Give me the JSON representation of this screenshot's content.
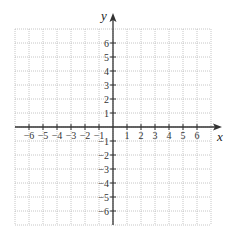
{
  "diagram": {
    "type": "coordinate-plane",
    "axes": {
      "x_label": "x",
      "y_label": "y",
      "x_range": [
        -7,
        7
      ],
      "y_range": [
        -7,
        7
      ]
    },
    "x_tick_labels": [
      "−6",
      "−5",
      "−4",
      "−3",
      "−2",
      "−1",
      "1",
      "2",
      "3",
      "4",
      "5",
      "6"
    ],
    "x_tick_values": [
      -6,
      -5,
      -4,
      -3,
      -2,
      -1,
      1,
      2,
      3,
      4,
      5,
      6
    ],
    "y_tick_labels": [
      "6",
      "5",
      "4",
      "3",
      "2",
      "1",
      "−1",
      "−2",
      "−3",
      "−4",
      "−5",
      "−6"
    ],
    "y_tick_values": [
      6,
      5,
      4,
      3,
      2,
      1,
      -1,
      -2,
      -3,
      -4,
      -5,
      -6
    ],
    "grid": {
      "style": "dotted",
      "spacing_units": 1,
      "color": "#b8b8b8"
    },
    "colors": {
      "axis": "#333333",
      "grid": "#b8b8b8",
      "text": "#333333"
    }
  }
}
